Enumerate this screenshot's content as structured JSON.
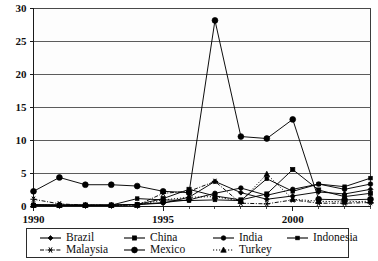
{
  "chart_data": {
    "type": "line",
    "title": "",
    "subtitle": "",
    "xlabel": "",
    "ylabel": "",
    "xlim": [
      1990,
      2003
    ],
    "ylim": [
      0,
      30
    ],
    "grid": true,
    "grid_axis": "y",
    "legend_position": "bottom",
    "legend_columns": 4,
    "x": [
      1990,
      1991,
      1992,
      1993,
      1994,
      1995,
      1996,
      1997,
      1998,
      1999,
      2000,
      2001,
      2002,
      2003
    ],
    "xticks": [
      1990,
      1995,
      2000
    ],
    "xtick_labels": [
      "1990",
      "1995",
      "2000"
    ],
    "yticks": [
      0,
      5,
      10,
      15,
      20,
      25,
      30
    ],
    "ytick_labels": [
      "0",
      "5",
      "10",
      "15",
      "20",
      "25",
      "30"
    ],
    "series": [
      {
        "name": "Brazil",
        "marker": "diamond",
        "linestyle": "solid",
        "values": [
          0.3,
          0.2,
          0.2,
          0.2,
          0.3,
          0.5,
          1.4,
          3.8,
          2.1,
          1.1,
          1.6,
          2.2,
          1.9,
          2.6
        ]
      },
      {
        "name": "China",
        "marker": "square",
        "linestyle": "solid",
        "values": [
          0.2,
          0.2,
          0.2,
          0.2,
          0.3,
          1.2,
          2.6,
          1.6,
          1.0,
          1.9,
          5.6,
          2.5,
          1.5,
          2.0
        ]
      },
      {
        "name": "India",
        "marker": "circle",
        "linestyle": "solid",
        "values": [
          0.2,
          0.2,
          0.2,
          0.2,
          0.3,
          0.6,
          1.0,
          2.0,
          2.8,
          1.7,
          2.6,
          3.4,
          2.6,
          3.4
        ]
      },
      {
        "name": "Indonesia",
        "marker": "square-small",
        "linestyle": "solid",
        "values": [
          0.2,
          0.2,
          0.2,
          0.2,
          1.2,
          1.0,
          0.9,
          1.0,
          0.9,
          4.2,
          2.3,
          3.4,
          3.0,
          4.3
        ]
      },
      {
        "name": "Malaysia",
        "marker": "star",
        "linestyle": "dash-dot",
        "values": [
          1.1,
          0.4,
          0.2,
          0.2,
          0.2,
          2.0,
          2.3,
          3.8,
          0.5,
          0.4,
          1.0,
          0.5,
          0.5,
          0.6
        ]
      },
      {
        "name": "Mexico",
        "marker": "circle-large",
        "linestyle": "solid",
        "values": [
          2.3,
          4.4,
          3.3,
          3.3,
          3.1,
          2.3,
          2.1,
          28.2,
          10.6,
          10.3,
          13.2,
          1.1,
          1.0,
          1.1
        ]
      },
      {
        "name": "Turkey",
        "marker": "triangle",
        "linestyle": "dotted",
        "values": [
          0.2,
          0.2,
          0.2,
          0.2,
          0.2,
          1.0,
          1.4,
          1.5,
          0.8,
          4.9,
          1.1,
          0.8,
          0.7,
          0.8
        ]
      }
    ]
  },
  "legend": {
    "entries": [
      {
        "label": "Brazil"
      },
      {
        "label": "China"
      },
      {
        "label": "India"
      },
      {
        "label": "Indonesia"
      },
      {
        "label": "Malaysia"
      },
      {
        "label": "Mexico"
      },
      {
        "label": "Turkey"
      }
    ]
  }
}
